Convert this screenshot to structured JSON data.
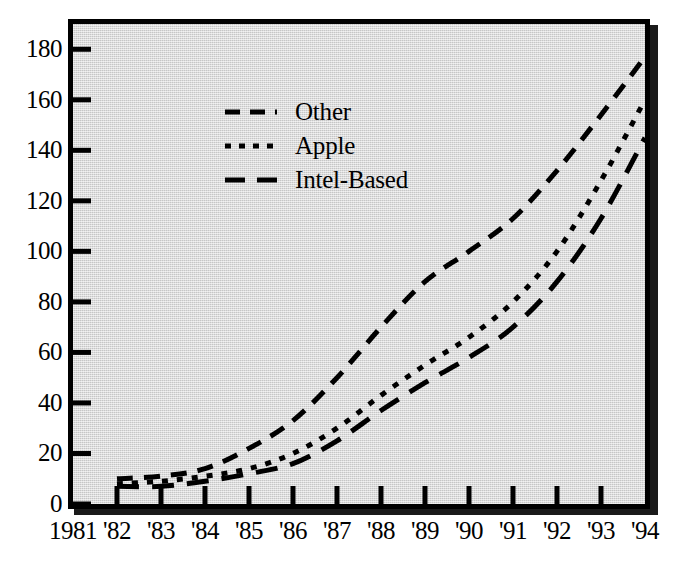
{
  "chart_data": {
    "type": "line",
    "title": "",
    "xlabel": "",
    "ylabel": "",
    "xlim": [
      1981,
      1994
    ],
    "ylim": [
      0,
      190
    ],
    "yticks": [
      0,
      20,
      40,
      60,
      80,
      100,
      120,
      140,
      160,
      180
    ],
    "xticks": [
      1981,
      1982,
      1983,
      1984,
      1985,
      1986,
      1987,
      1988,
      1989,
      1990,
      1991,
      1992,
      1993,
      1994
    ],
    "xtick_labels": [
      "1981",
      "'82",
      "'83",
      "'84",
      "'85",
      "'86",
      "'87",
      "'88",
      "'89",
      "'90",
      "'91",
      "'92",
      "'93",
      "'94"
    ],
    "grid": false,
    "legend_position": "upper-left",
    "x": [
      1982,
      1983,
      1984,
      1985,
      1986,
      1987,
      1988,
      1989,
      1990,
      1991,
      1992,
      1993,
      1994
    ],
    "series": [
      {
        "name": "Other",
        "dash": "medium-dash",
        "values": [
          10,
          11,
          14,
          22,
          33,
          50,
          70,
          88,
          100,
          113,
          132,
          154,
          177
        ]
      },
      {
        "name": "Apple",
        "dash": "dotted",
        "values": [
          8,
          9,
          11,
          14,
          20,
          30,
          43,
          55,
          66,
          80,
          100,
          128,
          160
        ]
      },
      {
        "name": "Intel-Based",
        "dash": "long-dash",
        "values": [
          7,
          7,
          9,
          12,
          16,
          25,
          37,
          48,
          58,
          70,
          88,
          113,
          145
        ]
      }
    ]
  },
  "axes": {
    "y_tick_labels": [
      "180",
      "160",
      "140",
      "120",
      "100",
      "80",
      "60",
      "40",
      "20",
      "0"
    ],
    "x_tick_labels": [
      "1981",
      "'82",
      "'83",
      "'84",
      "'85",
      "'86",
      "'87",
      "'88",
      "'89",
      "'90",
      "'91",
      "'92",
      "'93",
      "'94"
    ]
  },
  "legend": {
    "entries": [
      {
        "label": "Other"
      },
      {
        "label": "Apple"
      },
      {
        "label": "Intel-Based"
      }
    ]
  },
  "colors": {
    "plot_background": "#d4d4d4",
    "frame": "#000000",
    "line": "#000000",
    "page_background": "#ffffff"
  }
}
